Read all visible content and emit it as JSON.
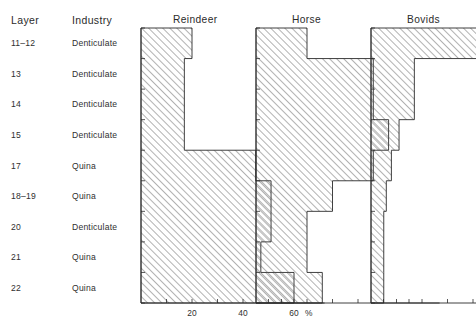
{
  "table": {
    "headers": {
      "layer": "Layer",
      "industry": "Industry"
    },
    "rows": [
      {
        "layer": "11–12",
        "industry": "Denticulate"
      },
      {
        "layer": "13",
        "industry": "Denticulate"
      },
      {
        "layer": "14",
        "industry": "Denticulate"
      },
      {
        "layer": "15",
        "industry": "Denticulate"
      },
      {
        "layer": "17",
        "industry": "Quina"
      },
      {
        "layer": "18–19",
        "industry": "Quina"
      },
      {
        "layer": "20",
        "industry": "Denticulate"
      },
      {
        "layer": "21",
        "industry": "Quina"
      },
      {
        "layer": "22",
        "industry": "Quina"
      }
    ]
  },
  "axis": {
    "unit": "%",
    "tick_labels": [
      "20",
      "40",
      "60"
    ],
    "tick_values": [
      20,
      40,
      60
    ],
    "minor_tick_values": [
      10,
      20,
      30,
      40,
      50,
      60
    ],
    "xmin": 0,
    "xmax": 72
  },
  "chart_data": [
    {
      "type": "bar",
      "orientation": "horizontal",
      "title": "Reindeer",
      "xlabel": "%",
      "ylabel": "Layer",
      "categories": [
        "11–12",
        "13",
        "14",
        "15",
        "17",
        "18–19",
        "20",
        "21",
        "22"
      ],
      "values": [
        20,
        17,
        17,
        17,
        45,
        51,
        51,
        47,
        60
      ],
      "xlim": [
        0,
        72
      ],
      "grid": false,
      "legend": "none",
      "fill": "diagonal-hatch"
    },
    {
      "type": "bar",
      "orientation": "horizontal",
      "title": "Horse",
      "xlabel": "%",
      "ylabel": "Layer",
      "categories": [
        "11–12",
        "13",
        "14",
        "15",
        "17",
        "18–19",
        "20",
        "21",
        "22"
      ],
      "values": [
        20,
        46,
        46,
        52,
        46,
        30,
        20,
        20,
        26
      ],
      "xlim": [
        0,
        72
      ],
      "grid": false,
      "legend": "none",
      "fill": "diagonal-hatch"
    },
    {
      "type": "bar",
      "orientation": "horizontal",
      "title": "Bovids",
      "xlabel": "%",
      "ylabel": "Layer",
      "categories": [
        "11–12",
        "13",
        "14",
        "15",
        "17",
        "18–19",
        "20",
        "21",
        "22"
      ],
      "values": [
        44,
        17,
        17,
        11,
        8,
        6,
        5,
        5,
        5
      ],
      "xlim": [
        0,
        72
      ],
      "grid": false,
      "legend": "none",
      "fill": "diagonal-hatch"
    }
  ],
  "style": {
    "line_color": "#2b2b2b",
    "hatch_color": "#555555",
    "background": "#ffffff"
  }
}
